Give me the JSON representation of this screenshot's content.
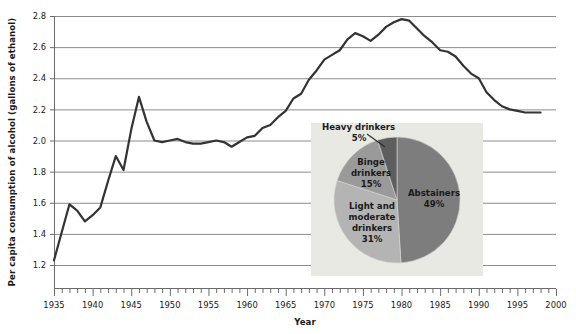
{
  "chart_data": [
    {
      "type": "line",
      "title": "",
      "xlabel": "Year",
      "ylabel": "Per capita consumption of alcohol (gallons of ethanol)",
      "xlim": [
        1935,
        2000
      ],
      "ylim": [
        1.2,
        2.8
      ],
      "xticks": [
        1935,
        1940,
        1945,
        1950,
        1955,
        1960,
        1965,
        1970,
        1975,
        1980,
        1985,
        1990,
        1995,
        2000
      ],
      "yticks": [
        1.2,
        1.4,
        1.6,
        1.8,
        2.0,
        2.2,
        2.4,
        2.6,
        2.8
      ],
      "ytick_labels": [
        "1.2",
        "1.4",
        "1.6",
        "1.8",
        "2.0",
        "2.2",
        "2.4",
        "2.6",
        "2.8"
      ],
      "xtick_labels": [
        "1935",
        "1940",
        "1945",
        "1950",
        "1955",
        "1960",
        "1965",
        "1970",
        "1975",
        "1980",
        "1985",
        "1990",
        "1995",
        "2000"
      ],
      "minor_xtick_interval": 1,
      "grid": "horizontal",
      "legend": "none",
      "line_color": "#333333",
      "line_width": 2.2,
      "x": [
        1935,
        1936,
        1937,
        1938,
        1939,
        1940,
        1941,
        1942,
        1943,
        1944,
        1945,
        1946,
        1947,
        1948,
        1949,
        1950,
        1951,
        1952,
        1953,
        1954,
        1955,
        1956,
        1957,
        1958,
        1959,
        1960,
        1961,
        1962,
        1963,
        1964,
        1965,
        1966,
        1967,
        1968,
        1969,
        1970,
        1971,
        1972,
        1973,
        1974,
        1975,
        1976,
        1977,
        1978,
        1979,
        1980,
        1981,
        1982,
        1983,
        1984,
        1985,
        1986,
        1987,
        1988,
        1989,
        1990,
        1991,
        1992,
        1993,
        1994,
        1995,
        1996,
        1997,
        1998
      ],
      "values": [
        1.23,
        1.41,
        1.59,
        1.55,
        1.48,
        1.52,
        1.57,
        1.74,
        1.9,
        1.81,
        2.07,
        2.28,
        2.12,
        2.0,
        1.99,
        2.0,
        2.01,
        1.99,
        1.98,
        1.98,
        1.99,
        2.0,
        1.99,
        1.96,
        1.99,
        2.02,
        2.03,
        2.08,
        2.1,
        2.15,
        2.19,
        2.27,
        2.3,
        2.39,
        2.45,
        2.52,
        2.55,
        2.58,
        2.65,
        2.69,
        2.67,
        2.64,
        2.68,
        2.73,
        2.76,
        2.78,
        2.77,
        2.72,
        2.67,
        2.63,
        2.58,
        2.57,
        2.54,
        2.48,
        2.43,
        2.4,
        2.31,
        2.26,
        2.22,
        2.2,
        2.19,
        2.18,
        2.18,
        2.18
      ]
    },
    {
      "type": "pie",
      "title": "",
      "inset": true,
      "labels": [
        "Abstainers",
        "Light and moderate drinkers",
        "Binge drinkers",
        "Heavy drinkers"
      ],
      "values": [
        49,
        31,
        15,
        5
      ],
      "value_labels": [
        "49%",
        "31%",
        "15%",
        "5%"
      ],
      "colors": [
        "#7d7d7d",
        "#b4b4b4",
        "#9a9a9a",
        "#5e5e5e"
      ],
      "background": "#e9e9e4",
      "label_lines": [
        [
          "Abstainers",
          "49%"
        ],
        [
          "Light and",
          "moderate",
          "drinkers",
          "31%"
        ],
        [
          "Binge",
          "drinkers",
          "15%"
        ],
        [
          "Heavy drinkers",
          "5%"
        ]
      ]
    }
  ],
  "axis": {
    "y_title": "Per capita consumption of alcohol (gallons of ethanol)",
    "x_title": "Year",
    "y_ticks": [
      "2.8",
      "2.6",
      "2.4",
      "2.2",
      "2.0",
      "1.8",
      "1.6",
      "1.4",
      "1.2"
    ],
    "x_ticks": [
      "1935",
      "1940",
      "1945",
      "1950",
      "1955",
      "1960",
      "1965",
      "1970",
      "1975",
      "1980",
      "1985",
      "1990",
      "1995",
      "2000"
    ]
  },
  "pie": {
    "abstainers_name": "Abstainers",
    "abstainers_pct": "49%",
    "light_line1": "Light and",
    "light_line2": "moderate",
    "light_line3": "drinkers",
    "light_pct": "31%",
    "binge_line1": "Binge",
    "binge_line2": "drinkers",
    "binge_pct": "15%",
    "heavy_name": "Heavy drinkers",
    "heavy_pct": "5%"
  },
  "colors": {
    "line": "#333333",
    "grid": "#8c8c8c",
    "axis": "#6b6b6b",
    "pie_bg": "#e9e9e4",
    "slice_abstainers": "#7d7d7d",
    "slice_light": "#b4b4b4",
    "slice_binge": "#9a9a9a",
    "slice_heavy": "#5e5e5e"
  }
}
